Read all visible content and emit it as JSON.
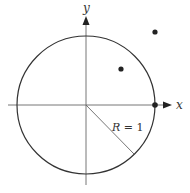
{
  "diagram": {
    "type": "unit-circle",
    "axes": {
      "x_label": "x",
      "y_label": "y"
    },
    "circle": {
      "radius_label_var": "R",
      "radius_label_eq": " = ",
      "radius_label_val": "1",
      "radius": 1
    },
    "points": [
      {
        "name": "point-inside-circle",
        "x": 0.5,
        "y": 0.5,
        "location": "inside"
      },
      {
        "name": "point-outside-circle",
        "x": 1.0,
        "y": 1.05,
        "location": "outside"
      },
      {
        "name": "point-on-circle",
        "x": 1.0,
        "y": 0.0,
        "location": "on circle"
      }
    ],
    "colors": {
      "stroke": "#333333",
      "axis": "#555555",
      "point": "#222222",
      "background": "#ffffff"
    }
  }
}
